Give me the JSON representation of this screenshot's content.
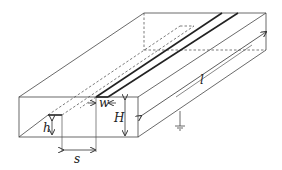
{
  "diagram": {
    "labels": {
      "length": "l",
      "height": "H",
      "width": "w",
      "sub_height": "h",
      "spacing": "s"
    },
    "colors": {
      "line": "#333333",
      "background": "#ffffff"
    }
  }
}
